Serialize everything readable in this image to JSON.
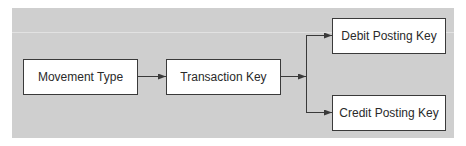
{
  "diagram": {
    "type": "flowchart",
    "nodes": [
      {
        "id": "movement_type",
        "label": "Movement Type"
      },
      {
        "id": "transaction_key",
        "label": "Transaction Key"
      },
      {
        "id": "debit_posting_key",
        "label": "Debit Posting Key"
      },
      {
        "id": "credit_posting_key",
        "label": "Credit Posting Key"
      }
    ],
    "edges": [
      {
        "from": "movement_type",
        "to": "transaction_key"
      },
      {
        "from": "transaction_key",
        "to": "debit_posting_key"
      },
      {
        "from": "transaction_key",
        "to": "credit_posting_key"
      }
    ],
    "colors": {
      "panel": "#cfcfcf",
      "box_fill": "#ffffff",
      "box_border": "#3a3a3a",
      "arrow": "#3a3a3a",
      "text": "#2a2a2a"
    }
  }
}
